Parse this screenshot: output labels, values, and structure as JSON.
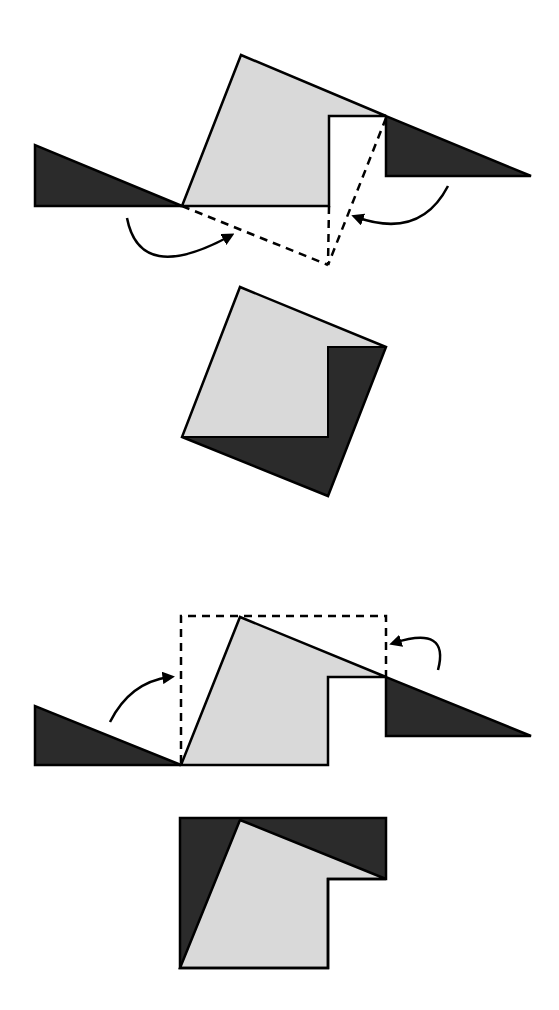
{
  "diagram": {
    "colors": {
      "dark": "#2b2b2b",
      "light": "#d9d9d9",
      "stroke": "#000000",
      "background": "#ffffff"
    },
    "figures": [
      {
        "id": "figure-1",
        "name": "rotation-to-square",
        "light_shape": [
          [
            182,
            206
          ],
          [
            241,
            55
          ],
          [
            386,
            116
          ],
          [
            329,
            116
          ],
          [
            329,
            206
          ]
        ],
        "left_triangle": [
          [
            35,
            145
          ],
          [
            35,
            206
          ],
          [
            182,
            206
          ]
        ],
        "right_triangle": [
          [
            386,
            116
          ],
          [
            386,
            176
          ],
          [
            531,
            176
          ]
        ],
        "dashed_lines": [
          [
            [
              182,
              206
            ],
            [
              328,
              265
            ]
          ],
          [
            [
              329,
              206
            ],
            [
              328,
              265
            ]
          ],
          [
            [
              386,
              116
            ],
            [
              328,
              265
            ]
          ]
        ],
        "arrows": [
          {
            "from": [
              127,
              218
            ],
            "ctrl": [
              150,
              275
            ],
            "to": [
              232,
              234
            ]
          },
          {
            "from": [
              448,
              186
            ],
            "ctrl": [
              420,
              235
            ],
            "to": [
              354,
              217
            ]
          }
        ]
      },
      {
        "id": "figure-2",
        "name": "resulting-square",
        "light_shape": [
          [
            182,
            437
          ],
          [
            240,
            287
          ],
          [
            386,
            347
          ],
          [
            328,
            347
          ],
          [
            328,
            437
          ]
        ],
        "dark_region": [
          [
            182,
            437
          ],
          [
            328,
            437
          ],
          [
            328,
            347
          ],
          [
            386,
            347
          ],
          [
            328,
            496
          ]
        ],
        "outline": [
          [
            240,
            287
          ],
          [
            386,
            347
          ],
          [
            328,
            496
          ],
          [
            182,
            437
          ]
        ]
      },
      {
        "id": "figure-3",
        "name": "rotation-to-rectangle",
        "light_shape": [
          [
            181,
            765
          ],
          [
            240,
            617
          ],
          [
            386,
            677
          ],
          [
            328,
            677
          ],
          [
            328,
            765
          ]
        ],
        "left_triangle": [
          [
            35,
            706
          ],
          [
            35,
            765
          ],
          [
            181,
            765
          ]
        ],
        "right_triangle": [
          [
            386,
            677
          ],
          [
            386,
            736
          ],
          [
            531,
            736
          ]
        ],
        "dashed_rect": [
          [
            181,
            765
          ],
          [
            181,
            616
          ],
          [
            386,
            616
          ],
          [
            386,
            677
          ]
        ],
        "arrows": [
          {
            "from": [
              110,
              722
            ],
            "ctrl": [
              130,
              680
            ],
            "to": [
              172,
              676
            ]
          },
          {
            "from": [
              438,
              670
            ],
            "ctrl": [
              445,
              630
            ],
            "to": [
              392,
              643
            ]
          }
        ]
      },
      {
        "id": "figure-4",
        "name": "resulting-l-shape",
        "outline": [
          [
            180,
            818
          ],
          [
            386,
            818
          ],
          [
            386,
            879
          ],
          [
            328,
            879
          ],
          [
            328,
            968
          ],
          [
            180,
            968
          ]
        ],
        "light_shape": [
          [
            180,
            968
          ],
          [
            240,
            820
          ],
          [
            386,
            879
          ],
          [
            328,
            879
          ],
          [
            328,
            968
          ]
        ]
      }
    ]
  }
}
